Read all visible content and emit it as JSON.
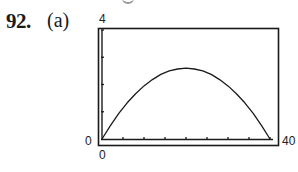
{
  "problem": {
    "number": "92.",
    "part": "(a)"
  },
  "axes": {
    "ymax_label": "4",
    "ymin_label": "0",
    "xmin_label": "0",
    "xmax_label": "40"
  },
  "chart_data": {
    "type": "line",
    "title": "",
    "xlabel": "",
    "ylabel": "",
    "xlim": [
      0,
      40
    ],
    "ylim": [
      0,
      4
    ],
    "grid": false,
    "legend": null,
    "x_ticks": [
      0,
      5,
      10,
      15,
      20,
      25,
      30,
      35,
      40
    ],
    "y_ticks": [
      0,
      1,
      2,
      3,
      4
    ],
    "series": [
      {
        "name": "curve",
        "x": [
          0,
          2,
          4,
          6,
          8,
          10,
          12,
          14,
          16,
          18,
          20,
          22,
          24,
          26,
          28,
          30,
          32,
          34,
          36,
          38,
          40
        ],
        "values": [
          0,
          0.49,
          0.94,
          1.33,
          1.66,
          1.95,
          2.18,
          2.37,
          2.5,
          2.57,
          2.6,
          2.57,
          2.5,
          2.37,
          2.18,
          1.95,
          1.66,
          1.33,
          0.94,
          0.49,
          0
        ]
      }
    ],
    "annotations": [
      "graphing calculator window: x from 0 to 40, y from 0 to 4"
    ]
  }
}
